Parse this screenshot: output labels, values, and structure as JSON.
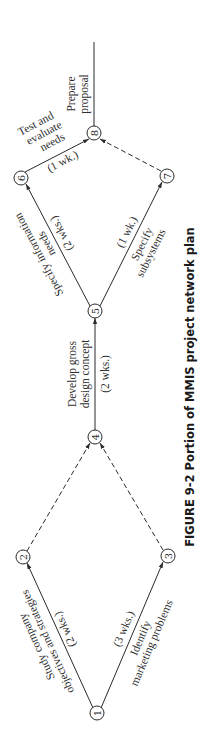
{
  "figure": {
    "caption": "FIGURE 9-2  Portion of MMIS project network plan",
    "orientation": "rotated-90-ccw",
    "colors": {
      "ink": "#2a2a2a",
      "background": "#ffffff"
    }
  },
  "nodes": [
    {
      "id": "1",
      "label": "1"
    },
    {
      "id": "2",
      "label": "2"
    },
    {
      "id": "3",
      "label": "3"
    },
    {
      "id": "4",
      "label": "4"
    },
    {
      "id": "5",
      "label": "5"
    },
    {
      "id": "6",
      "label": "6"
    },
    {
      "id": "7",
      "label": "7"
    },
    {
      "id": "8",
      "label": "8"
    }
  ],
  "activities": {
    "a12": {
      "from": "1",
      "to": "2",
      "line1": "Study company",
      "line2": "objectives and strategies",
      "duration": "(2 wks.)"
    },
    "a13": {
      "from": "1",
      "to": "3",
      "line1": "Identify",
      "line2": "marketing problems",
      "duration": "(3 wks.)"
    },
    "d24": {
      "from": "2",
      "to": "4",
      "type": "dummy"
    },
    "d34": {
      "from": "3",
      "to": "4",
      "type": "dummy"
    },
    "a45": {
      "from": "4",
      "to": "5",
      "line1": "Develop gross",
      "line2": "design concept",
      "duration": "(2 wks.)"
    },
    "a56": {
      "from": "5",
      "to": "6",
      "line1": "Specify information",
      "line2": "needs",
      "duration": "(2 wks.)"
    },
    "a57": {
      "from": "5",
      "to": "7",
      "line1": "Specify",
      "line2": "subsystems",
      "duration": "(1 wk.)"
    },
    "a68": {
      "from": "6",
      "to": "8",
      "line1": "Test and",
      "line2": "evaluate",
      "line3": "needs",
      "duration": "(1 wk.)"
    },
    "d78": {
      "from": "7",
      "to": "8",
      "type": "dummy"
    },
    "a8x": {
      "from": "8",
      "to": "end",
      "line1": "Prepare",
      "line2": "proposal"
    }
  }
}
